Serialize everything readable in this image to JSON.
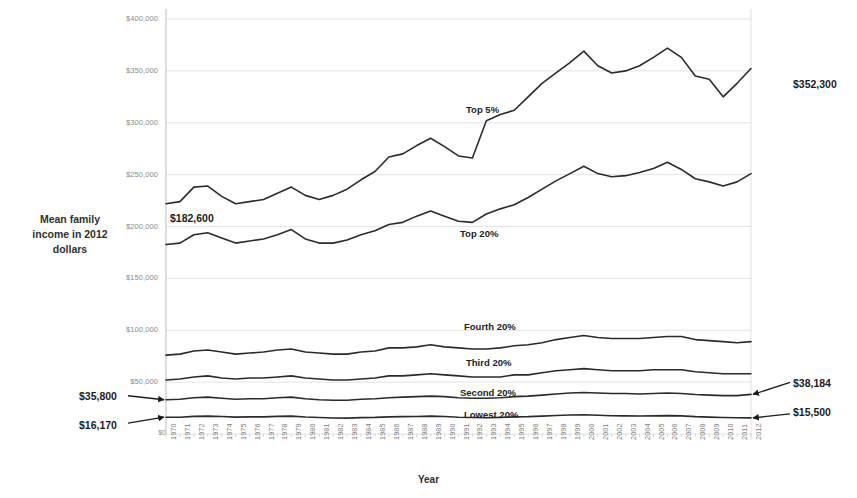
{
  "chart_data": {
    "type": "line",
    "title": "",
    "xlabel": "Year",
    "ylabel": "Mean family income in 2012 dollars",
    "grid": true,
    "legend_position": "inline-on-series",
    "xlim": [
      1970,
      2012
    ],
    "ylim": [
      0,
      400000
    ],
    "yticks": [
      0,
      50000,
      100000,
      150000,
      200000,
      250000,
      300000,
      350000,
      400000
    ],
    "ytick_labels": [
      "$0",
      "$50,000",
      "$100,000",
      "$150,000",
      "$200,000",
      "$250,000",
      "$300,000",
      "$350,000",
      "$400,000"
    ],
    "x": [
      1970,
      1971,
      1972,
      1973,
      1974,
      1975,
      1976,
      1977,
      1978,
      1979,
      1980,
      1981,
      1982,
      1983,
      1984,
      1985,
      1986,
      1987,
      1988,
      1989,
      1990,
      1991,
      1992,
      1993,
      1994,
      1995,
      1996,
      1997,
      1998,
      1999,
      2000,
      2001,
      2002,
      2003,
      2004,
      2005,
      2006,
      2007,
      2008,
      2009,
      2010,
      2011,
      2012
    ],
    "xtick_labels": [
      "1970",
      "1971",
      "1972",
      "1973",
      "1974",
      "1975",
      "1976",
      "1977",
      "1978",
      "1979",
      "1980",
      "1981",
      "1982",
      "1983",
      "1984",
      "1985",
      "1986",
      "1987",
      "1988",
      "1989",
      "1990",
      "1991",
      "1992",
      "1993",
      "1994",
      "1995",
      "1996",
      "1997",
      "1998",
      "1999",
      "2000",
      "2001",
      "2002",
      "2003",
      "2004",
      "2005",
      "2006",
      "2007",
      "2008",
      "2009",
      "2010",
      "2011",
      "2012"
    ],
    "series": [
      {
        "name": "Top 5%",
        "label": "Top 5%",
        "color": "#2b2b2b",
        "values": [
          222000,
          224000,
          238000,
          239000,
          229000,
          222000,
          224000,
          226000,
          232000,
          238000,
          230000,
          226000,
          230000,
          236000,
          245000,
          253000,
          267000,
          270000,
          278000,
          285000,
          277000,
          268000,
          266000,
          302000,
          308000,
          312000,
          325000,
          338000,
          348000,
          358000,
          369000,
          355000,
          348000,
          350000,
          355000,
          363000,
          372000,
          363000,
          345000,
          342000,
          325000,
          338000,
          352300
        ]
      },
      {
        "name": "Top 20%",
        "label": "Top 20%",
        "color": "#2b2b2b",
        "values": [
          182600,
          184000,
          192000,
          194000,
          189000,
          184000,
          186000,
          188000,
          192000,
          197000,
          188000,
          184000,
          184000,
          187000,
          192000,
          196000,
          202000,
          204000,
          210000,
          215000,
          210000,
          205000,
          204000,
          212000,
          217000,
          221000,
          228000,
          236000,
          244000,
          251000,
          258000,
          251000,
          248000,
          249000,
          252000,
          256000,
          262000,
          255000,
          246000,
          243000,
          239000,
          243000,
          251000
        ]
      },
      {
        "name": "Fourth 20%",
        "label": "Fourth 20%",
        "color": "#2b2b2b",
        "values": [
          76000,
          77000,
          80000,
          81000,
          79000,
          77000,
          78000,
          79000,
          81000,
          82000,
          79000,
          78000,
          77000,
          77000,
          79000,
          80000,
          83000,
          83000,
          84000,
          86000,
          84000,
          83000,
          82000,
          82000,
          83000,
          85000,
          86000,
          88000,
          91000,
          93000,
          95000,
          93000,
          92000,
          92000,
          92000,
          93000,
          94000,
          94000,
          91000,
          90000,
          89000,
          88000,
          89000
        ]
      },
      {
        "name": "Third 20%",
        "label": "Third 20%",
        "color": "#2b2b2b",
        "values": [
          52000,
          53000,
          55000,
          56000,
          54000,
          53000,
          54000,
          54000,
          55000,
          56000,
          54000,
          53000,
          52000,
          52000,
          53000,
          54000,
          56000,
          56000,
          57000,
          58000,
          57000,
          56000,
          55000,
          55000,
          55000,
          57000,
          57000,
          59000,
          61000,
          62000,
          63000,
          62000,
          61000,
          61000,
          61000,
          62000,
          62000,
          62000,
          60000,
          59000,
          58000,
          58000,
          58000
        ]
      },
      {
        "name": "Second 20%",
        "label": "Second 20%",
        "color": "#2b2b2b",
        "values": [
          33000,
          33500,
          35000,
          35500,
          34500,
          33500,
          34000,
          34000,
          35000,
          35500,
          34000,
          33000,
          32500,
          32500,
          33500,
          34000,
          35000,
          35500,
          36000,
          36500,
          36000,
          35000,
          34500,
          34500,
          35000,
          36000,
          36500,
          37500,
          38500,
          39500,
          40000,
          39500,
          39000,
          39000,
          38500,
          39000,
          39500,
          39000,
          38000,
          37500,
          37000,
          37000,
          38184
        ]
      },
      {
        "name": "Lowest 20%",
        "label": "Lowest 20%",
        "color": "#2b2b2b",
        "values": [
          16170,
          16200,
          17000,
          17200,
          16800,
          16300,
          16500,
          16500,
          17000,
          17200,
          16400,
          15900,
          15400,
          15300,
          15800,
          16000,
          16500,
          16700,
          16900,
          17200,
          16800,
          16200,
          15900,
          15700,
          16000,
          16500,
          16700,
          17200,
          17800,
          18300,
          18500,
          18000,
          17600,
          17500,
          17400,
          17500,
          17700,
          17500,
          16700,
          16300,
          15900,
          15600,
          15500
        ]
      }
    ],
    "annotations": [
      {
        "id": "start-top20",
        "text": "$182,600",
        "side": "none",
        "target_series": "Top 20%",
        "target_year": 1970
      },
      {
        "id": "end-top5",
        "text": "$352,300",
        "side": "right",
        "target_series": "Top 5%",
        "target_year": 2012
      },
      {
        "id": "end-second20",
        "text": "$38,184",
        "side": "right",
        "target_series": "Second 20%",
        "target_year": 2012
      },
      {
        "id": "end-lowest20",
        "text": "$15,500",
        "side": "right",
        "target_series": "Lowest 20%",
        "target_year": 2012
      },
      {
        "id": "start-second20",
        "text": "$35,800",
        "side": "left",
        "target_series": "Second 20%",
        "target_year": 1970
      },
      {
        "id": "start-lowest20",
        "text": "$16,170",
        "side": "left",
        "target_series": "Lowest 20%",
        "target_year": 1970
      }
    ]
  },
  "axis": {
    "y_title_line1": "Mean family",
    "y_title_line2": "income in 2012",
    "y_title_line3": "dollars",
    "x_title": "Year"
  },
  "colors": {
    "line": "#2b2b2b",
    "grid": "#e3e3e6",
    "axis": "#c9c9cc",
    "tick_text": "#8a8a8a",
    "label_text": "#232323"
  }
}
